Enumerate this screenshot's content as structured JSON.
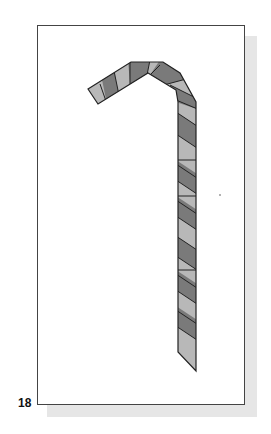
{
  "figure": {
    "page_number": "18",
    "colors": {
      "frame_border": "#444444",
      "shadow": "#e6e6e6",
      "stripe_light": "#b8b8b8",
      "stripe_dark": "#7a7a7a",
      "outline": "#222222"
    }
  }
}
